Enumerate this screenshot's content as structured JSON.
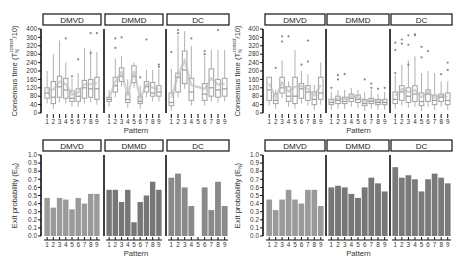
{
  "chart_data": [
    {
      "type": "box",
      "panel": "top-left",
      "ylabel": "Consensus time (T_N^correct/10)",
      "xlabel": "Pattern",
      "ylim": [
        0,
        400
      ],
      "yticks": [
        0,
        40,
        80,
        120,
        160,
        200,
        240,
        280,
        320,
        360,
        400
      ],
      "categories": [
        "1",
        "2",
        "3",
        "4",
        "5",
        "6",
        "7",
        "8",
        "9"
      ],
      "facets": [
        {
          "name": "DMVD",
          "medians": [
            95,
            75,
            125,
            110,
            70,
            80,
            120,
            115,
            115
          ],
          "q1": [
            70,
            45,
            75,
            70,
            55,
            55,
            70,
            75,
            65
          ],
          "q3": [
            120,
            150,
            175,
            165,
            105,
            115,
            155,
            160,
            170
          ],
          "whisker_hi": [
            200,
            280,
            345,
            240,
            165,
            190,
            310,
            300,
            290
          ],
          "outliers": [
            [],
            [],
            [],
            [
              355
            ],
            [
              175
            ],
            [
              255
            ],
            [],
            [
              285,
              380
            ],
            [
              380
            ]
          ]
        },
        {
          "name": "DMMD",
          "medians": [
            65,
            130,
            175,
            65,
            175,
            55,
            125,
            95,
            100
          ],
          "q1": [
            55,
            100,
            150,
            50,
            145,
            45,
            100,
            80,
            80
          ],
          "q3": [
            75,
            170,
            215,
            95,
            225,
            80,
            150,
            145,
            130
          ],
          "whisker_hi": [
            110,
            260,
            270,
            160,
            240,
            130,
            205,
            205,
            210
          ],
          "outliers": [
            [],
            [
              310,
              355
            ],
            [
              360
            ],
            [],
            [],
            [
              170
            ],
            [
              350
            ],
            [],
            [
              220,
              230
            ]
          ]
        },
        {
          "name": "DC",
          "medians": [
            50,
            170,
            205,
            100,
            null,
            90,
            120,
            110,
            115
          ],
          "q1": [
            35,
            100,
            140,
            60,
            null,
            60,
            80,
            75,
            80
          ],
          "q3": [
            95,
            190,
            295,
            165,
            null,
            140,
            210,
            160,
            165
          ],
          "whisker_hi": [
            210,
            370,
            390,
            320,
            null,
            270,
            300,
            300,
            300
          ],
          "outliers": [
            [
              290
            ],
            [
              380,
              395
            ],
            [],
            [
              355
            ],
            [],
            [
              280,
              295
            ],
            [],
            [
              395
            ],
            []
          ]
        }
      ]
    },
    {
      "type": "box",
      "panel": "top-right",
      "ylabel": "Consensus time (T_N^correct/10)",
      "xlabel": "Pattern",
      "ylim": [
        0,
        400
      ],
      "yticks": [
        0,
        40,
        80,
        120,
        160,
        200,
        240,
        280,
        320,
        360,
        400
      ],
      "categories": [
        "1",
        "2",
        "3",
        "4",
        "5",
        "6",
        "7",
        "8",
        "9"
      ],
      "facets": [
        {
          "name": "DMVD",
          "medians": [
            110,
            60,
            120,
            80,
            80,
            115,
            100,
            65,
            95
          ],
          "q1": [
            60,
            45,
            95,
            55,
            45,
            70,
            60,
            40,
            65
          ],
          "q3": [
            170,
            90,
            170,
            125,
            170,
            140,
            130,
            100,
            170
          ],
          "whisker_hi": [
            170,
            110,
            250,
            150,
            300,
            200,
            185,
            135,
            240
          ],
          "outliers": [
            [],
            [
              215
            ],
            [
              340,
              365
            ],
            [
              365
            ],
            [],
            [
              230
            ],
            [
              245,
              345
            ],
            [],
            []
          ]
        },
        {
          "name": "DMMD",
          "medians": [
            50,
            60,
            55,
            70,
            65,
            45,
            55,
            50,
            50
          ],
          "q1": [
            40,
            45,
            45,
            55,
            50,
            35,
            45,
            40,
            40
          ],
          "q3": [
            65,
            80,
            75,
            90,
            85,
            65,
            70,
            65,
            65
          ],
          "whisker_hi": [
            100,
            110,
            110,
            120,
            110,
            100,
            110,
            90,
            100
          ],
          "outliers": [
            [
              120
            ],
            [
              160,
              180
            ],
            [
              185
            ],
            [],
            [],
            [
              160
            ],
            [
              140,
              120
            ],
            [
              115
            ],
            [
              120
            ]
          ]
        },
        {
          "name": "DC",
          "medians": [
            65,
            100,
            80,
            90,
            55,
            90,
            60,
            75,
            60
          ],
          "q1": [
            45,
            60,
            50,
            55,
            35,
            55,
            40,
            55,
            40
          ],
          "q3": [
            100,
            130,
            120,
            130,
            95,
            110,
            85,
            90,
            95
          ],
          "whisker_hi": [
            180,
            230,
            250,
            270,
            190,
            200,
            190,
            150,
            150
          ],
          "outliers": [
            [
              190,
              300,
              335
            ],
            [
              330,
              350
            ],
            [
              230,
              325,
              370
            ],
            [
              370,
              375
            ],
            [
              265,
              315
            ],
            [
              295
            ],
            [],
            [
              185
            ],
            [
              205,
              240
            ]
          ]
        }
      ]
    },
    {
      "type": "bar",
      "panel": "bottom-left",
      "ylabel": "Exit probability (E_N)",
      "xlabel": "Pattern",
      "ylim": [
        0,
        1.0
      ],
      "yticks": [
        "0.0",
        "0.1",
        "0.2",
        "0.3",
        "0.4",
        "0.5",
        "0.6",
        "0.7",
        "0.8",
        "0.9",
        "1.0"
      ],
      "categories": [
        "1",
        "2",
        "3",
        "4",
        "5",
        "6",
        "7",
        "8",
        "9"
      ],
      "series": [
        {
          "name": "DMVD",
          "values": [
            0.47,
            0.35,
            0.47,
            0.45,
            0.33,
            0.47,
            0.4,
            0.52,
            0.52
          ],
          "color": "#9a9a9a"
        },
        {
          "name": "DMMD",
          "values": [
            0.57,
            0.57,
            0.42,
            0.57,
            0.17,
            0.42,
            0.5,
            0.67,
            0.57
          ],
          "color": "#777777"
        },
        {
          "name": "DC",
          "values": [
            0.72,
            0.77,
            0.6,
            0.37,
            0.0,
            0.6,
            0.32,
            0.67,
            0.37
          ],
          "color": "#8a8a8a"
        }
      ]
    },
    {
      "type": "bar",
      "panel": "bottom-right",
      "ylabel": "Exit probability (E_N)",
      "xlabel": "Pattern",
      "ylim": [
        0,
        1.0
      ],
      "yticks": [
        "0.0",
        "0.1",
        "0.2",
        "0.3",
        "0.4",
        "0.5",
        "0.6",
        "0.7",
        "0.8",
        "0.9",
        "1.0"
      ],
      "categories": [
        "1",
        "2",
        "3",
        "4",
        "5",
        "6",
        "7",
        "8",
        "9"
      ],
      "series": [
        {
          "name": "DMVD",
          "values": [
            0.45,
            0.32,
            0.45,
            0.57,
            0.45,
            0.4,
            0.57,
            0.57,
            0.37
          ],
          "color": "#9a9a9a"
        },
        {
          "name": "DMMD",
          "values": [
            0.6,
            0.62,
            0.6,
            0.52,
            0.47,
            0.6,
            0.72,
            0.65,
            0.55
          ],
          "color": "#777777"
        },
        {
          "name": "DC",
          "values": [
            0.85,
            0.72,
            0.75,
            0.7,
            0.55,
            0.7,
            0.77,
            0.72,
            0.65
          ],
          "color": "#7a7a7a"
        }
      ]
    }
  ],
  "labels": {
    "facet_names": [
      "DMVD",
      "DMMD",
      "DC"
    ],
    "xlabel": "Pattern",
    "ylabel_box": "Consensus time (T",
    "ylabel_box_sub": "N",
    "ylabel_box_sup": "correct",
    "ylabel_box_tail": "/10)",
    "ylabel_bar": "Exit probability (E",
    "ylabel_bar_sub": "N",
    "ylabel_bar_tail": ")"
  },
  "colors": {
    "box_stroke": "#a8a8a8",
    "median_line": "#999999",
    "outlier": "#888888",
    "axis": "#111111"
  }
}
